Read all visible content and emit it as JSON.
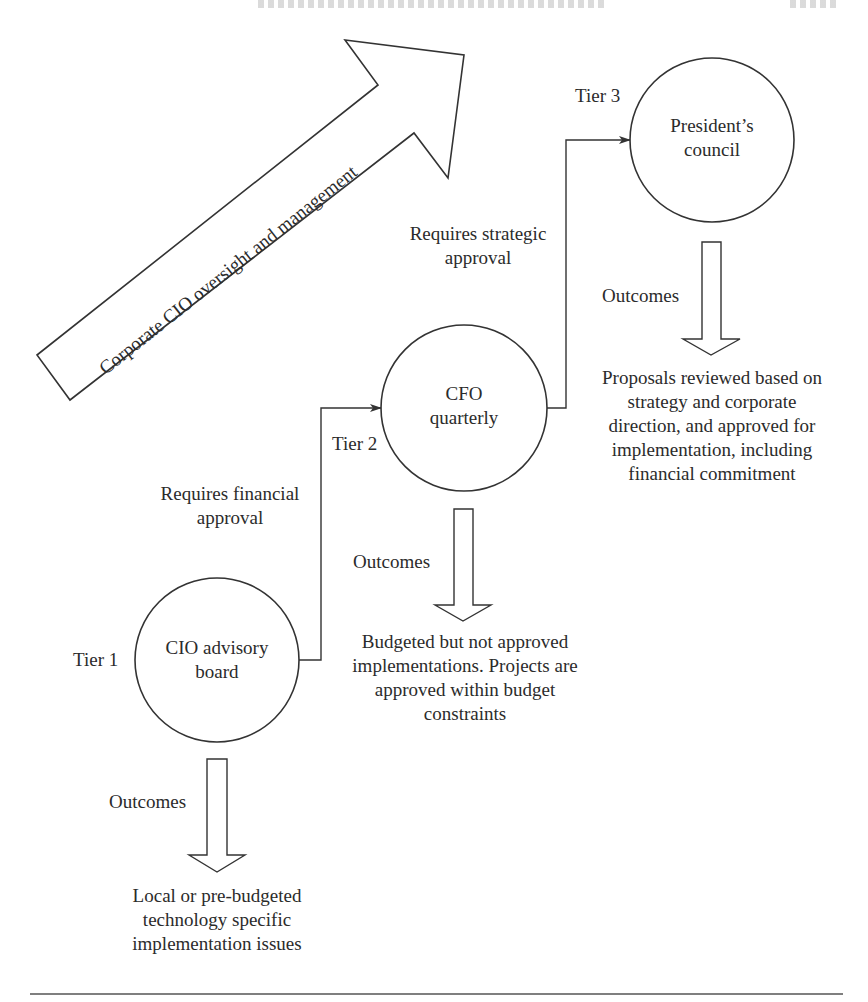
{
  "diagram": {
    "colors": {
      "line": "#333333",
      "text": "#2b2b2b",
      "background": "#ffffff"
    },
    "oversight_arrow": {
      "label": "Corporate CIO oversight and management"
    },
    "tiers": [
      {
        "tier_label": "Tier 1",
        "node_lines": [
          "CIO advisory",
          "board"
        ],
        "outcome_label": "Outcomes",
        "outcome_text": [
          "Local or pre-budgeted",
          "technology specific",
          "implementation issues"
        ]
      },
      {
        "tier_label": "Tier 2",
        "node_lines": [
          "CFO",
          "quarterly"
        ],
        "outcome_label": "Outcomes",
        "outcome_text": [
          "Budgeted but not approved",
          "implementations. Projects are",
          "approved within budget",
          "constraints"
        ]
      },
      {
        "tier_label": "Tier 3",
        "node_lines": [
          "President’s",
          "council"
        ],
        "outcome_label": "Outcomes",
        "outcome_text": [
          "Proposals reviewed based on",
          "strategy and corporate",
          "direction, and approved for",
          "implementation, including",
          "financial commitment"
        ]
      }
    ],
    "connectors": [
      {
        "from": "Tier 1",
        "to": "Tier 2",
        "label": [
          "Requires financial",
          "approval"
        ]
      },
      {
        "from": "Tier 2",
        "to": "Tier 3",
        "label": [
          "Requires strategic",
          "approval"
        ]
      }
    ]
  }
}
